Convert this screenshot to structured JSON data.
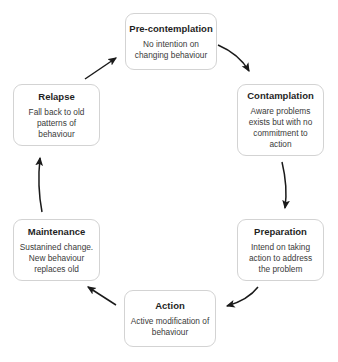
{
  "diagram": {
    "name": "stages-of-change-cycle",
    "top_artifact_text": "",
    "style": {
      "box_border_color": "#d3d3d3",
      "box_background": "#ffffff",
      "arrow_color": "#1a1a1a",
      "title_color": "#1f1f1f",
      "text_color": "#3a3a3a"
    },
    "stages": [
      {
        "id": "pre-contemplation",
        "title": "Pre-contemplation",
        "description": "No intention on changing behaviour"
      },
      {
        "id": "contamplation",
        "title": "Contamplation",
        "description": "Aware problems exists but with no commitment to action"
      },
      {
        "id": "preparation",
        "title": "Preparation",
        "description": "Intend on taking action to address the problem"
      },
      {
        "id": "action",
        "title": "Action",
        "description": "Active modification of behaviour"
      },
      {
        "id": "maintenance",
        "title": "Maintenance",
        "description": "Sustanined change. New behaviour replaces old"
      },
      {
        "id": "relapse",
        "title": "Relapse",
        "description": "Fall back to old patterns of behaviour"
      }
    ],
    "arrows": [
      {
        "id": "arrow-precontemplation-to-contamplation",
        "from": "pre-contemplation",
        "to": "contamplation",
        "direction": "down-right"
      },
      {
        "id": "arrow-contamplation-to-preparation",
        "from": "contamplation",
        "to": "preparation",
        "direction": "down"
      },
      {
        "id": "arrow-preparation-to-action",
        "from": "preparation",
        "to": "action",
        "direction": "down-left"
      },
      {
        "id": "arrow-action-to-maintenance",
        "from": "action",
        "to": "maintenance",
        "direction": "up-left"
      },
      {
        "id": "arrow-maintenance-to-relapse",
        "from": "maintenance",
        "to": "relapse",
        "direction": "up"
      },
      {
        "id": "arrow-relapse-to-precontemplation",
        "from": "relapse",
        "to": "pre-contemplation",
        "direction": "up-right"
      }
    ]
  }
}
